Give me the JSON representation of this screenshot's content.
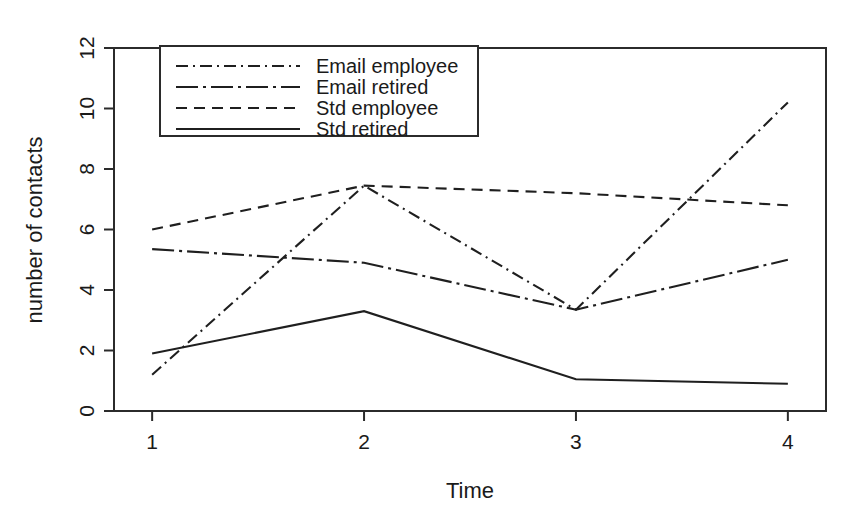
{
  "chart_data": {
    "type": "line",
    "title": "",
    "subtitle": "",
    "xlabel": "Time",
    "ylabel": "number of contacts",
    "x": [
      1,
      2,
      3,
      4
    ],
    "categories": [
      "1",
      "2",
      "3",
      "4"
    ],
    "xtick_labels": [
      "1",
      "2",
      "3",
      "4"
    ],
    "ytick_labels": [
      "0",
      "2",
      "4",
      "6",
      "8",
      "10",
      "12"
    ],
    "ytick_values": [
      0,
      2,
      4,
      6,
      8,
      10,
      12
    ],
    "xlim": [
      0.82,
      4.18
    ],
    "ylim": [
      0,
      12
    ],
    "grid": false,
    "legend_position": "top-left-inside",
    "series": [
      {
        "name": "Email employee",
        "linestyle": "dash-dot",
        "dasharray": "12,5,2,5",
        "color": "#1f1f1f",
        "values": [
          1.2,
          7.45,
          3.35,
          10.2
        ]
      },
      {
        "name": "Email retired",
        "linestyle": "long-dash-dot",
        "dasharray": "22,5,3,5",
        "color": "#1f1f1f",
        "values": [
          5.35,
          4.9,
          3.35,
          5.0
        ]
      },
      {
        "name": "Std employee",
        "linestyle": "dashed",
        "dasharray": "11,7",
        "color": "#1f1f1f",
        "values": [
          6.0,
          7.45,
          7.2,
          6.8
        ]
      },
      {
        "name": "Std retired",
        "linestyle": "solid",
        "dasharray": "none",
        "color": "#1f1f1f",
        "values": [
          1.9,
          3.3,
          1.05,
          0.9
        ]
      }
    ]
  }
}
